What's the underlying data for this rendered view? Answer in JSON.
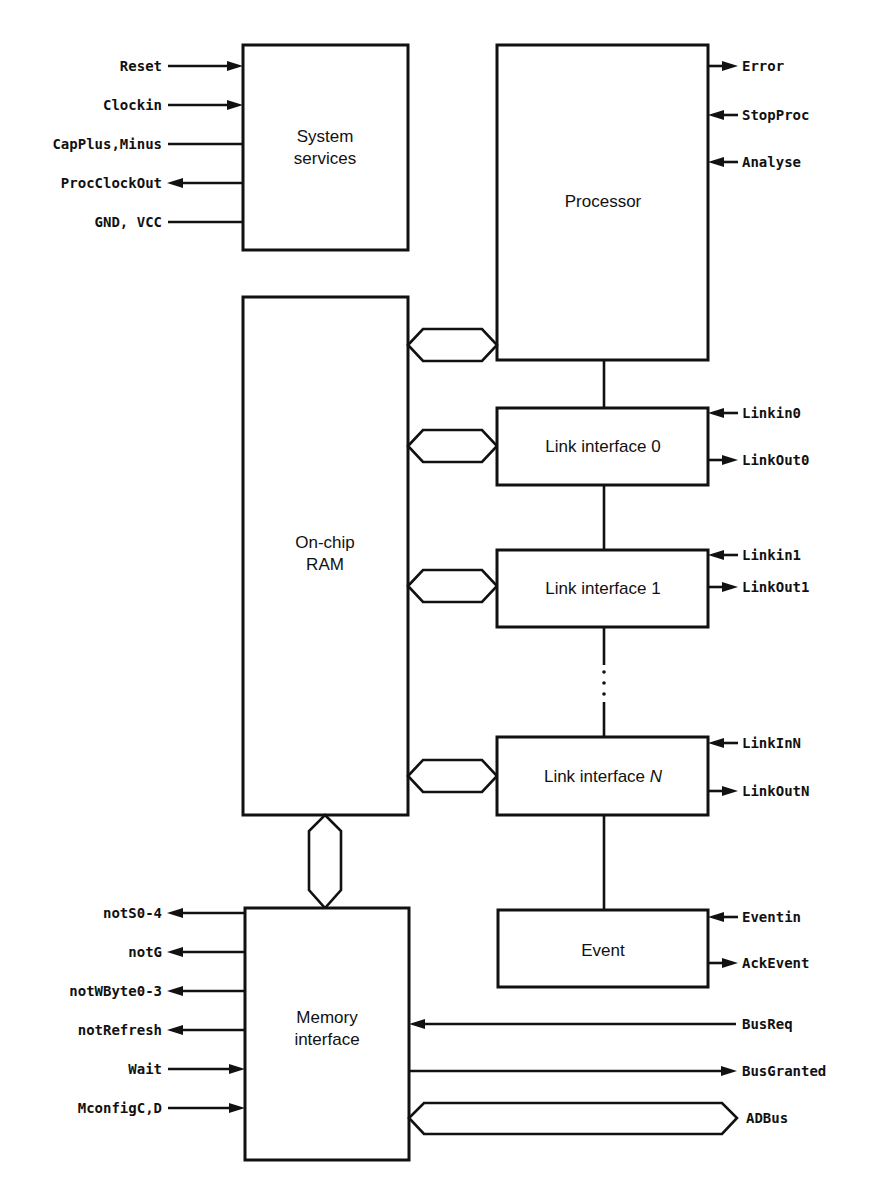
{
  "diagram": {
    "blocks": {
      "system_services": {
        "line1": "System",
        "line2": "services"
      },
      "processor": {
        "label": "Processor"
      },
      "ram": {
        "line1": "On-chip",
        "line2": "RAM"
      },
      "link0": {
        "label": "Link interface 0"
      },
      "link1": {
        "label": "Link interface 1"
      },
      "linkN": {
        "label_prefix": "Link interface ",
        "label_italic": "N"
      },
      "event": {
        "label": "Event"
      },
      "memory": {
        "line1": "Memory",
        "line2": "interface"
      }
    },
    "signals": {
      "system_services": [
        {
          "name": "Reset",
          "direction": "in"
        },
        {
          "name": "Clockin",
          "direction": "in"
        },
        {
          "name": "CapPlus,Minus",
          "direction": "none"
        },
        {
          "name": "ProcClockOut",
          "direction": "out"
        },
        {
          "name": "GND, VCC",
          "direction": "none"
        }
      ],
      "processor": [
        {
          "name": "Error",
          "direction": "out"
        },
        {
          "name": "StopProc",
          "direction": "in"
        },
        {
          "name": "Analyse",
          "direction": "in"
        }
      ],
      "link0": [
        {
          "name": "Linkin0",
          "direction": "in"
        },
        {
          "name": "LinkOut0",
          "direction": "out"
        }
      ],
      "link1": [
        {
          "name": "Linkin1",
          "direction": "in"
        },
        {
          "name": "LinkOut1",
          "direction": "out"
        }
      ],
      "linkN": [
        {
          "name": "LinkInN",
          "direction": "in"
        },
        {
          "name": "LinkOutN",
          "direction": "out"
        }
      ],
      "event": [
        {
          "name": "Eventin",
          "direction": "in"
        },
        {
          "name": "AckEvent",
          "direction": "out"
        }
      ],
      "memory_left": [
        {
          "name": "notS0-4",
          "direction": "out"
        },
        {
          "name": "notG",
          "direction": "out"
        },
        {
          "name": "notWByte0-3",
          "direction": "out"
        },
        {
          "name": "notRefresh",
          "direction": "out"
        },
        {
          "name": "Wait",
          "direction": "in"
        },
        {
          "name": "MconfigC,D",
          "direction": "in"
        }
      ],
      "memory_right": [
        {
          "name": "BusReq",
          "direction": "in"
        },
        {
          "name": "BusGranted",
          "direction": "out"
        },
        {
          "name": "ADBus",
          "direction": "bidirectional-bus"
        }
      ]
    }
  }
}
